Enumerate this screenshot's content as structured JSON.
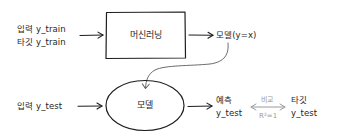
{
  "diagram": {
    "title": "",
    "training_stage": {
      "inputs": {
        "input_label": "입력 y_train",
        "target_label": "타깃 y_train"
      },
      "process_box": {
        "label": "머신러닝",
        "shape": "rectangle"
      },
      "output": {
        "label": "모델(y=x)"
      }
    },
    "test_stage": {
      "input": {
        "label": "입력 y_test"
      },
      "model_node": {
        "label": "모델",
        "shape": "ellipse"
      },
      "prediction": {
        "line1": "예측",
        "line2": "y_test"
      },
      "comparison": {
        "top_label": "비교",
        "bottom_label": "R²=1",
        "arrow": "double-headed",
        "color": "#9a9a9a"
      },
      "target": {
        "line1": "타깃",
        "line2": "y_test"
      }
    },
    "edges": [
      {
        "from": "training inputs",
        "to": "머신러닝",
        "style": "solid-arrow"
      },
      {
        "from": "머신러닝",
        "to": "모델(y=x)",
        "style": "solid-arrow"
      },
      {
        "from": "모델(y=x)",
        "to": "모델",
        "style": "curved-arrow"
      },
      {
        "from": "입력 y_test",
        "to": "모델",
        "style": "solid-arrow"
      },
      {
        "from": "모델",
        "to": "예측 y_test",
        "style": "solid-arrow"
      },
      {
        "from": "예측 y_test",
        "to": "타깃 y_test",
        "style": "double-arrow-gray"
      }
    ],
    "colors": {
      "stroke": "#1e1e1e",
      "comparison": "#9a9a9a",
      "background": "#ffffff"
    }
  }
}
